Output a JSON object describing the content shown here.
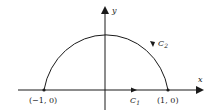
{
  "diagram": {
    "axes": {
      "x_label": "x",
      "y_label": "y"
    },
    "points": [
      {
        "name": "left-endpoint",
        "label": "(−1, 0)"
      },
      {
        "name": "right-endpoint",
        "label": "(1, 0)"
      }
    ],
    "curves": [
      {
        "name": "C1",
        "label_main": "C",
        "label_sub": "1",
        "description": "segment along x-axis from (-1,0) to (1,0), oriented rightward"
      },
      {
        "name": "C2",
        "label_main": "C",
        "label_sub": "2",
        "description": "upper unit semicircle from (1,0) to (-1,0), oriented counterclockwise"
      }
    ],
    "colors": {
      "stroke": "#1a1a1a",
      "background": "#ffffff"
    }
  }
}
